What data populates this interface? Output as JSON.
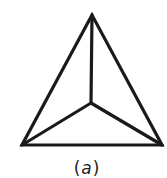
{
  "diagram": {
    "type": "tetrahedron-projection",
    "label_open": "(",
    "label_letter": "a",
    "label_close": ")",
    "stroke_color": "#1a1a1a",
    "vertices": {
      "apex": [
        92,
        15
      ],
      "bottom_left": [
        22,
        145
      ],
      "bottom_right": [
        162,
        145
      ],
      "center": [
        91,
        103
      ]
    }
  }
}
